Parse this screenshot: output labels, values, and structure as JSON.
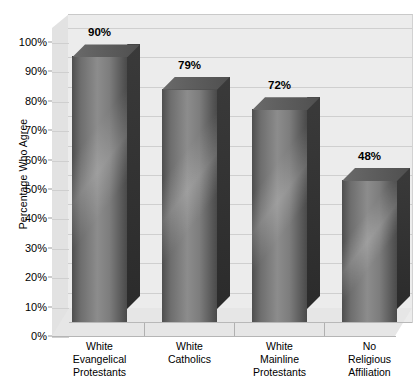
{
  "chart_data": {
    "type": "bar",
    "title": "",
    "xlabel": "",
    "ylabel": "Percentage Who Agree",
    "ylim": [
      0,
      100
    ],
    "ytick_labels": [
      "0%",
      "10%",
      "20%",
      "30%",
      "40%",
      "50%",
      "60%",
      "70%",
      "80%",
      "90%",
      "100%"
    ],
    "ytick_values": [
      0,
      10,
      20,
      30,
      40,
      50,
      60,
      70,
      80,
      90,
      100
    ],
    "grid": true,
    "legend": "none",
    "style": "3d-bar",
    "categories": [
      "White Evangelical Protestants",
      "White Catholics",
      "White Mainline Protestants",
      "No Religious Affiliation"
    ],
    "category_lines": [
      [
        "White",
        "Evangelical",
        "Protestants"
      ],
      [
        "White",
        "Catholics"
      ],
      [
        "White",
        "Mainline",
        "Protestants"
      ],
      [
        "No",
        "Religious",
        "Affiliation"
      ]
    ],
    "values": [
      90,
      79,
      72,
      48
    ],
    "value_labels": [
      "90%",
      "79%",
      "72%",
      "48%"
    ],
    "colors": {
      "bar_face_light": "#8c8c8c",
      "bar_face_dark": "#4a4a4a",
      "bar_side": "#2f2f2f",
      "plot_background": "#ececec",
      "gridline": "#cfcfcf",
      "text": "#000000"
    }
  }
}
